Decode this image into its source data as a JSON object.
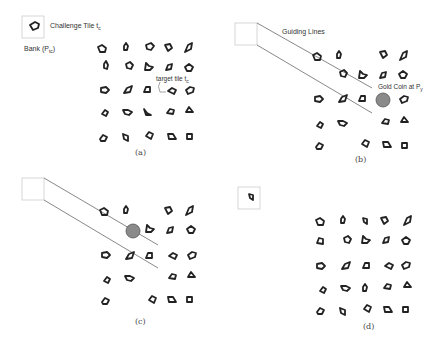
{
  "panels": {
    "a": {
      "caption": "(a)",
      "challenge_label": "Challenge Tile t",
      "challenge_sub": "c",
      "bank_label": "Bank (P",
      "bank_sub": "tc",
      "bank_close": ")",
      "target_label": "target tile t",
      "target_sub": "c"
    },
    "b": {
      "caption": "(b)",
      "guiding_label": "Guiding Lines",
      "coin_label": "Gold Coin at P",
      "coin_sub": "y"
    },
    "c": {
      "caption": "(c)"
    },
    "d": {
      "caption": "(d)"
    }
  },
  "colors": {
    "stroke": "#222222",
    "coin": "#8a8a8a",
    "line": "#555555",
    "box": "#cccccc"
  }
}
